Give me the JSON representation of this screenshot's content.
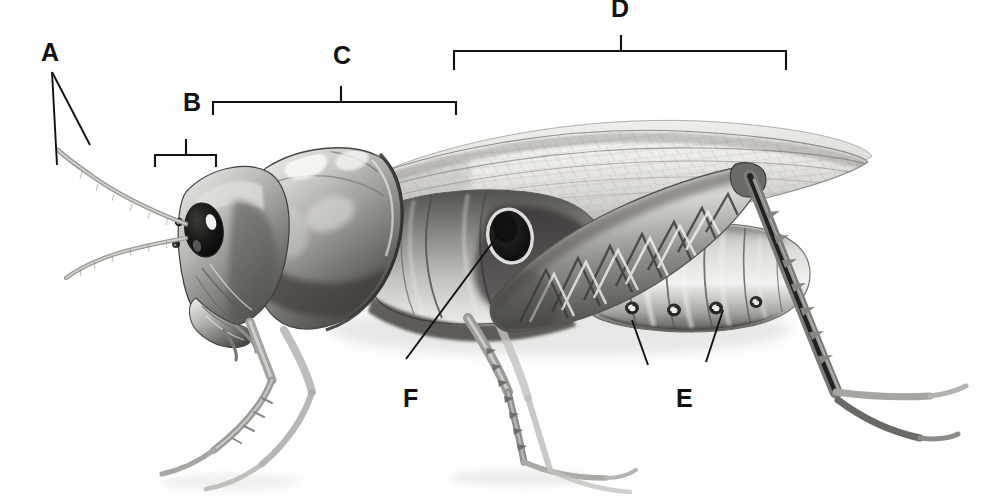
{
  "figure": {
    "view": "lateral",
    "style": "graphite pencil illustration",
    "background_color": "#ffffff",
    "ink_color": "#111111",
    "width": 1003,
    "height": 501
  },
  "labels": [
    {
      "id": "A",
      "text": "A",
      "x": 41,
      "y": 40,
      "marker": "leader-lines",
      "points_to": "antennae"
    },
    {
      "id": "B",
      "text": "B",
      "x": 183,
      "y": 90,
      "marker": "bracket",
      "points_to": "head"
    },
    {
      "id": "C",
      "text": "C",
      "x": 333,
      "y": 43,
      "marker": "bracket",
      "points_to": "thorax"
    },
    {
      "id": "D",
      "text": "D",
      "x": 611,
      "y": -4,
      "marker": "bracket",
      "points_to": "abdomen"
    },
    {
      "id": "E",
      "text": "E",
      "x": 676,
      "y": 386,
      "marker": "leader-lines",
      "points_to": "spiracles"
    },
    {
      "id": "F",
      "text": "F",
      "x": 403,
      "y": 386,
      "marker": "leader-line",
      "points_to": "tympanum"
    }
  ],
  "brackets": [
    {
      "id": "bracket-b",
      "label": "B",
      "x1": 155,
      "x2": 216,
      "y": 155,
      "tick_x": 186,
      "tick_top": 139,
      "end_depth": 12
    },
    {
      "id": "bracket-c",
      "label": "C",
      "x1": 213,
      "x2": 456,
      "y": 102,
      "tick_x": 341,
      "tick_top": 86,
      "end_depth": 13
    },
    {
      "id": "bracket-d",
      "label": "D",
      "x1": 454,
      "x2": 786,
      "y": 51,
      "tick_x": 621,
      "tick_top": 35,
      "end_depth": 19
    }
  ],
  "leaders": [
    {
      "id": "leader-a-1",
      "label": "A",
      "x1": 52,
      "y1": 72,
      "x2": 57,
      "y2": 165
    },
    {
      "id": "leader-a-2",
      "label": "A",
      "x1": 52,
      "y1": 72,
      "x2": 90,
      "y2": 145
    },
    {
      "id": "leader-f-1",
      "label": "F",
      "x1": 406,
      "y1": 359,
      "x2": 504,
      "y2": 227
    },
    {
      "id": "leader-e-1",
      "label": "E",
      "x1": 648,
      "y1": 365,
      "x2": 632,
      "y2": 320
    },
    {
      "id": "leader-e-2",
      "label": "E",
      "x1": 706,
      "y1": 362,
      "x2": 723,
      "y2": 310
    }
  ],
  "anatomy_parts": [
    "antenna",
    "compound-eye",
    "ocelli",
    "head",
    "mouthparts",
    "pronotum",
    "thorax",
    "forewing",
    "hindwing",
    "tympanum",
    "abdomen",
    "spiracles",
    "foreleg",
    "midleg",
    "hind-femur",
    "hind-tibia",
    "tarsus"
  ]
}
